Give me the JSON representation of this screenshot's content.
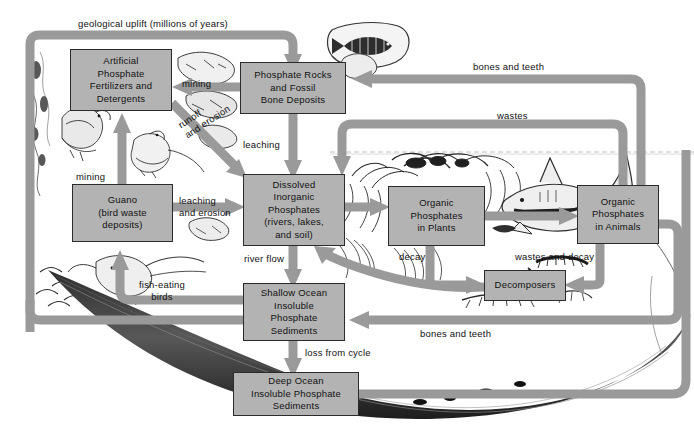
{
  "figure": {
    "palette": {
      "arrow": "#9a9a9a",
      "box_fill": "#b3b3b3",
      "box_stroke": "#2b2b2b",
      "text": "#111111",
      "background": "#ffffff",
      "sediment_dark": "#3a3a3a"
    }
  },
  "boxes": [
    {
      "id": "fertilizers",
      "label": "Artificial\nPhosphate\nFertilizers and\nDetergents",
      "x": 70,
      "y": 49,
      "w": 102,
      "h": 62
    },
    {
      "id": "rocks",
      "label": "Phosphate Rocks\nand Fossil\nBone Deposits",
      "x": 240,
      "y": 62,
      "w": 106,
      "h": 52
    },
    {
      "id": "guano",
      "label": "Guano\n(bird waste\ndeposits)",
      "x": 72,
      "y": 184,
      "w": 101,
      "h": 58
    },
    {
      "id": "dissolved",
      "label": "Dissolved\nInorganic\nPhosphates\n(rivers, lakes,\nand soil)",
      "x": 243,
      "y": 174,
      "w": 102,
      "h": 72
    },
    {
      "id": "plants",
      "label": "Organic\nPhosphates\nin Plants",
      "x": 388,
      "y": 186,
      "w": 97,
      "h": 60
    },
    {
      "id": "animals",
      "label": "Organic\nPhosphates\nin Animals",
      "x": 577,
      "y": 185,
      "w": 82,
      "h": 59
    },
    {
      "id": "decomposers",
      "label": "Decomposers",
      "x": 484,
      "y": 270,
      "w": 82,
      "h": 31
    },
    {
      "id": "shallow",
      "label": "Shallow Ocean\nInsoluble\nPhosphate\nSediments",
      "x": 243,
      "y": 283,
      "w": 102,
      "h": 58
    },
    {
      "id": "deep",
      "label": "Deep Ocean\nInsoluble Phosphate\nSediments",
      "x": 233,
      "y": 372,
      "w": 126,
      "h": 44
    }
  ],
  "labels": [
    {
      "id": "geological-uplift",
      "text": "geological uplift (millions of years)",
      "x": 78,
      "y": 18,
      "align": "left",
      "rot": 0
    },
    {
      "id": "mining-top",
      "text": "mining",
      "x": 182,
      "y": 78,
      "align": "left",
      "rot": 0
    },
    {
      "id": "bones-teeth-top",
      "text": "bones and teeth",
      "x": 473,
      "y": 66,
      "align": "left",
      "rot": 0
    },
    {
      "id": "wastes",
      "text": "wastes",
      "x": 497,
      "y": 112,
      "align": "left",
      "rot": 0
    },
    {
      "id": "runoff-erosion",
      "text": "runoff\nand erosion",
      "x": 176,
      "y": 119,
      "align": "left",
      "rot": -33
    },
    {
      "id": "leaching-top",
      "text": "leaching",
      "x": 243,
      "y": 140,
      "align": "left",
      "rot": 0
    },
    {
      "id": "mining-left",
      "text": "mining",
      "x": 76,
      "y": 172,
      "align": "left",
      "rot": 0
    },
    {
      "id": "leaching-erosion",
      "text": "leaching\nand erosion",
      "x": 180,
      "y": 196,
      "align": "left",
      "rot": 0
    },
    {
      "id": "river-flow",
      "text": "river flow",
      "x": 244,
      "y": 254,
      "align": "left",
      "rot": 0
    },
    {
      "id": "decay",
      "text": "decay",
      "x": 400,
      "y": 252,
      "align": "left",
      "rot": 0
    },
    {
      "id": "wastes-and-decay",
      "text": "wastes and decay",
      "x": 516,
      "y": 252,
      "align": "left",
      "rot": 0
    },
    {
      "id": "fish-eating-birds",
      "text": "fish-eating\nbirds",
      "x": 152,
      "y": 281,
      "align": "center",
      "rot": 0
    },
    {
      "id": "bones-teeth-bottom",
      "text": "bones and teeth",
      "x": 420,
      "y": 329,
      "align": "left",
      "rot": 0
    },
    {
      "id": "loss-from-cycle",
      "text": "loss from cycle",
      "x": 305,
      "y": 348,
      "align": "left",
      "rot": 0
    }
  ],
  "flows": [
    {
      "id": "uplift",
      "from": "deep-ocean-loop",
      "to": "rocks",
      "label": "geological uplift (millions of years)"
    },
    {
      "id": "mining-rocks",
      "from": "rocks",
      "to": "fertilizers",
      "label": "mining"
    },
    {
      "id": "mining-guano",
      "from": "guano",
      "to": "fertilizers",
      "label": "mining"
    },
    {
      "id": "runoff",
      "from": "fertilizers",
      "to": "dissolved",
      "label": "runoff and erosion"
    },
    {
      "id": "leaching-rocks",
      "from": "rocks",
      "to": "dissolved",
      "label": "leaching"
    },
    {
      "id": "leaching-guano",
      "from": "guano",
      "to": "dissolved",
      "label": "leaching and erosion"
    },
    {
      "id": "uptake-plants",
      "from": "dissolved",
      "to": "plants",
      "label": ""
    },
    {
      "id": "plants-to-animals",
      "from": "plants",
      "to": "animals",
      "label": ""
    },
    {
      "id": "plant-decay",
      "from": "plants",
      "to": "decomposers",
      "label": "decay"
    },
    {
      "id": "animal-wastes-decay",
      "from": "animals",
      "to": "decomposers",
      "label": "wastes and decay"
    },
    {
      "id": "decomposers-dissolved",
      "from": "decomposers",
      "to": "dissolved",
      "label": ""
    },
    {
      "id": "animal-wastes",
      "from": "animals",
      "to": "dissolved",
      "label": "wastes"
    },
    {
      "id": "bones-teeth-rocks",
      "from": "animals",
      "to": "rocks",
      "label": "bones and teeth"
    },
    {
      "id": "bones-teeth-shallow",
      "from": "animals",
      "to": "shallow",
      "label": "bones and teeth"
    },
    {
      "id": "river-flow",
      "from": "dissolved",
      "to": "shallow",
      "label": "river flow"
    },
    {
      "id": "shallow-loss",
      "from": "shallow",
      "to": "deep",
      "label": "loss from cycle"
    },
    {
      "id": "fish-eating-birds",
      "from": "shallow",
      "to": "guano",
      "label": "fish-eating birds"
    },
    {
      "id": "shallow-uplift",
      "from": "shallow",
      "to": "uplift-track",
      "label": ""
    }
  ]
}
